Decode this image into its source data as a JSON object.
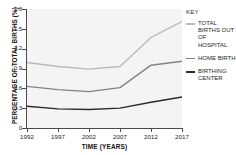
{
  "chart_data": {
    "type": "line",
    "title": "",
    "xlabel": "TIME (YEARS)",
    "ylabel": "PERCENTAGE OF TOTAL BIRTHS (%)",
    "x": [
      1992,
      1997,
      2002,
      2007,
      2012,
      2017
    ],
    "xtick_labels": [
      "1992",
      "1997",
      "2002",
      "2007",
      "2012",
      "2017"
    ],
    "ytick_labels": [
      "0",
      "0.3",
      "0.6",
      "0.9",
      "1.2",
      "1.5",
      "1.8"
    ],
    "yticks": [
      0,
      0.3,
      0.6,
      0.9,
      1.2,
      1.5,
      1.8
    ],
    "xlim": [
      1992,
      2017
    ],
    "ylim": [
      0,
      1.8
    ],
    "grid": false,
    "legend_position": "right",
    "series": [
      {
        "name": "TOTAL BIRTHS OUT OF HOSPITAL",
        "color": "#b9b9b9",
        "values": [
          0.99,
          0.93,
          0.89,
          0.93,
          1.37,
          1.61
        ]
      },
      {
        "name": "HOME BIRTH",
        "color": "#848484",
        "values": [
          0.63,
          0.58,
          0.55,
          0.61,
          0.95,
          1.01
        ]
      },
      {
        "name": "BIRTHING CENTER",
        "color": "#2b2b2b",
        "values": [
          0.33,
          0.29,
          0.28,
          0.3,
          0.39,
          0.47
        ]
      }
    ]
  },
  "legend": {
    "title": "KEY",
    "items": [
      {
        "label": "TOTAL BIRTHS OUT OF HOSPITAL",
        "color": "#b9b9b9"
      },
      {
        "label": "HOME BIRTH",
        "color": "#848484"
      },
      {
        "label": "BIRTHING CENTER",
        "color": "#2b2b2b"
      }
    ]
  }
}
